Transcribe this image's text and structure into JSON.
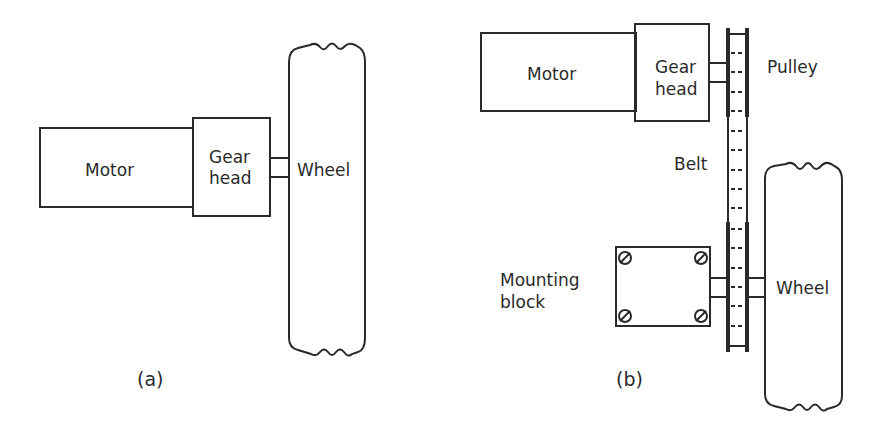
{
  "diagram_a": {
    "motor_label": "Motor",
    "gearhead_label_line1": "Gear",
    "gearhead_label_line2": "head",
    "wheel_label": "Wheel",
    "caption": "(a)"
  },
  "diagram_b": {
    "motor_label": "Motor",
    "gearhead_label_line1": "Gear",
    "gearhead_label_line2": "head",
    "pulley_label": "Pulley",
    "belt_label": "Belt",
    "mounting_label_line1": "Mounting",
    "mounting_label_line2": "block",
    "wheel_label": "Wheel",
    "caption": "(b)"
  },
  "colors": {
    "line": "#2a2a2a",
    "background": "#ffffff"
  }
}
